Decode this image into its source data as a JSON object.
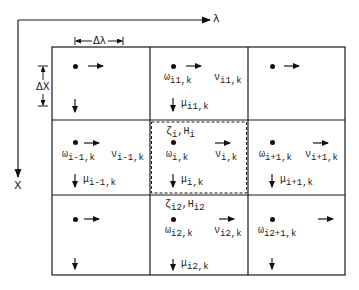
{
  "axes": {
    "horizontal_label": "λ",
    "vertical_label": "X",
    "delta_lambda": "Δλ",
    "delta_x": "ΔX"
  },
  "grid": {
    "rows": 3,
    "cols": 3,
    "cells": [
      [
        {
          "omega": "",
          "v": "",
          "mu": "",
          "top": ""
        },
        {
          "omega": {
            "sym": "ω",
            "sub": "i1,k"
          },
          "v": {
            "sym": "ν",
            "sub": "i1,k"
          },
          "mu": {
            "sym": "μ",
            "sub": "i1,k"
          },
          "top": ""
        },
        {
          "omega": "",
          "v": "",
          "mu": "",
          "top": ""
        }
      ],
      [
        {
          "omega": {
            "sym": "ω",
            "sub": "i-1,k"
          },
          "v": {
            "sym": "ν",
            "sub": "i-1,k"
          },
          "mu": {
            "sym": "μ",
            "sub": "i-1,k"
          },
          "top": ""
        },
        {
          "omega": {
            "sym": "ω",
            "sub": "i,k"
          },
          "v": {
            "sym": "ν",
            "sub": "i,k"
          },
          "mu": {
            "sym": "μ",
            "sub": "i,k"
          },
          "top": {
            "sym": "ζ",
            "sub": "i",
            "sym2": "H",
            "sub2": "i"
          }
        },
        {
          "omega": {
            "sym": "ω",
            "sub": "i+1,k"
          },
          "v": {
            "sym": "ν",
            "sub": "i+1,k"
          },
          "mu": {
            "sym": "μ",
            "sub": "i+1,k"
          },
          "top": ""
        }
      ],
      [
        {
          "omega": "",
          "v": "",
          "mu": "",
          "top": ""
        },
        {
          "omega": {
            "sym": "ω",
            "sub": "i2,k"
          },
          "v": {
            "sym": "ν",
            "sub": "i2,k"
          },
          "mu": {
            "sym": "μ",
            "sub": "i2,k"
          },
          "top": {
            "sym": "ζ",
            "sub": "i2",
            "sym2": "H",
            "sub2": "i2"
          }
        },
        {
          "omega": {
            "sym": "ω",
            "sub": "i2+1,k"
          },
          "v": "",
          "mu": "",
          "top": ""
        }
      ]
    ],
    "highlighted_cell": "center (dashed outline)"
  },
  "colors": {
    "line": "#1a1a1a",
    "background": "#ffffff"
  }
}
